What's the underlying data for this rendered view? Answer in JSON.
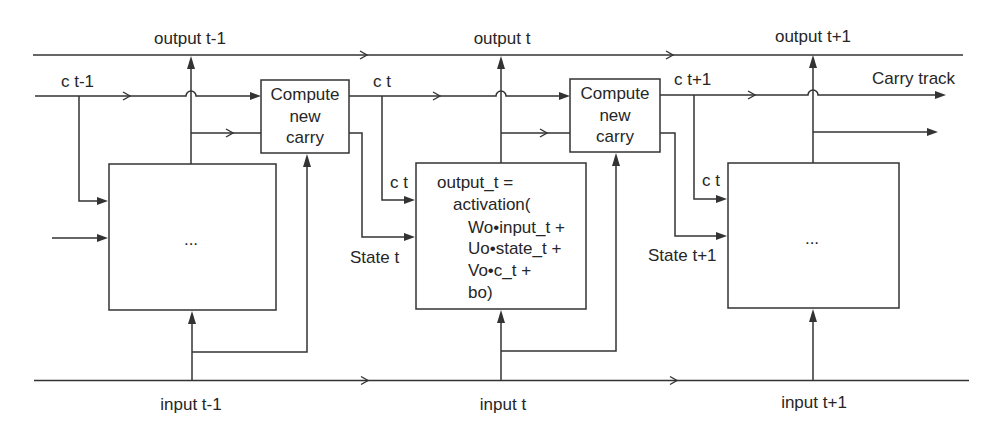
{
  "labels": {
    "carry_track": "Carry track"
  },
  "steps": [
    {
      "output": "output t-1",
      "carry": "c t-1",
      "input": "input t-1",
      "cell": {
        "lines": [
          "..."
        ]
      }
    },
    {
      "output": "output t",
      "carry": "c t",
      "input": "input t",
      "cell_carry_in": "c t",
      "state_in": "State t",
      "cell": {
        "lines": [
          "output_t =",
          "activation(",
          "Wo•input_t +",
          "Uo•state_t +",
          "Vo•c_t +",
          "bo)"
        ]
      }
    },
    {
      "output": "output t+1",
      "carry": "c t+1",
      "input": "input t+1",
      "cell_carry_in": "c t",
      "state_in": "State t+1",
      "cell": {
        "lines": [
          "..."
        ]
      }
    }
  ],
  "compute_carry_boxes": [
    {
      "lines": [
        "Compute",
        "new",
        "carry"
      ]
    },
    {
      "lines": [
        "Compute",
        "new",
        "carry"
      ]
    }
  ],
  "colors": {
    "background": "#ffffff",
    "stroke": "#333333",
    "text": "#262626"
  }
}
